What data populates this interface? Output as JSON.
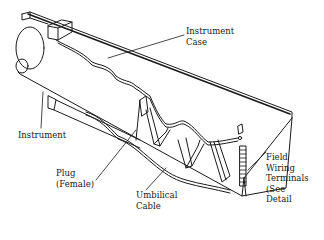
{
  "diagram": {
    "labels": {
      "instrument_case": "Instrument\nCase",
      "instrument": "Instrument",
      "plug": "Plug\n(Female)",
      "umbilical_cable": "Umbilical\nCable",
      "field_wiring_terminals": "Field\nWiring\nTerminals\n(See\nDetail"
    },
    "colors": {
      "ink": "#1a1a1a",
      "background": "#ffffff"
    }
  }
}
